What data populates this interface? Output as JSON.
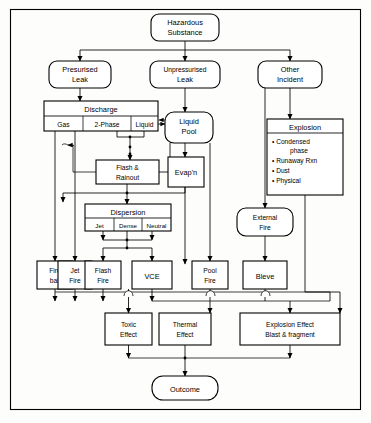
{
  "diagram": {
    "colors": {
      "background": "#fdfdfb",
      "stroke": "#000000",
      "node_fill": "#ffffff"
    },
    "nodes": {
      "hazardous_substance": {
        "line1": "Hazardous",
        "line2": "Substance",
        "shape": "rounded-terminator"
      },
      "presurised_leak": {
        "line1": "Presurised",
        "line2": "Leak",
        "shape": "rounded-terminator"
      },
      "unpressurised_leak": {
        "line1": "Unpressurised",
        "line2": "Leak",
        "shape": "rounded-terminator"
      },
      "other_incident": {
        "line1": "Other",
        "line2": "Incident",
        "shape": "rounded-terminator"
      },
      "discharge": {
        "header": "Discharge",
        "cells": [
          "Gas",
          "2-Phase",
          "Liquid"
        ],
        "shape": "table"
      },
      "liquid_pool": {
        "line1": "Liquid",
        "line2": "Pool",
        "shape": "rounded-terminator"
      },
      "explosion": {
        "header": "Explosion",
        "items": [
          "Condensed",
          "phase",
          "Runaway Rxn",
          "Dust",
          "Physical"
        ],
        "bullets": [
          "Condensed phase",
          "Runaway Rxn",
          "Dust",
          "Physical"
        ],
        "shape": "table"
      },
      "flash_rainout": {
        "line1": "Flash &",
        "line2": "Rainout",
        "shape": "rect"
      },
      "evapn": {
        "line1": "Evap'n",
        "shape": "rect"
      },
      "dispersion": {
        "header": "Dispersion",
        "cells": [
          "Jet",
          "Dense",
          "Neutral"
        ],
        "shape": "table"
      },
      "external_fire": {
        "line1": "External",
        "line2": "Fire",
        "shape": "rounded-terminator"
      },
      "fire_ball": {
        "line1": "Fire",
        "line2": "ball",
        "shape": "rect"
      },
      "jet_fire": {
        "line1": "Jet",
        "line2": "Fire",
        "shape": "rect"
      },
      "flash_fire": {
        "line1": "Flash",
        "line2": "Fire",
        "shape": "rect"
      },
      "vce": {
        "line1": "VCE",
        "shape": "rect"
      },
      "pool_fire": {
        "line1": "Pool",
        "line2": "Fire",
        "shape": "rect"
      },
      "bleve": {
        "line1": "Bleve",
        "shape": "rect"
      },
      "toxic_effect": {
        "line1": "Toxic",
        "line2": "Effect",
        "shape": "rect"
      },
      "thermal_effect": {
        "line1": "Thermal",
        "line2": "Effect",
        "shape": "rect"
      },
      "explosion_effect": {
        "line1": "Explosion Effect",
        "line2": "Blast & fragment",
        "shape": "rect"
      },
      "outcome": {
        "line1": "Outcome",
        "shape": "rounded-terminator"
      }
    }
  }
}
